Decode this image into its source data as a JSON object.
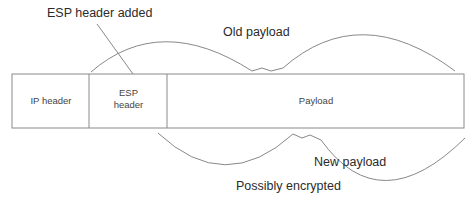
{
  "diagram": {
    "annotations": {
      "esp_added": "ESP header added",
      "old_payload": "Old payload",
      "new_payload": "New payload",
      "possibly_encrypted": "Possibly encrypted"
    },
    "packet": {
      "segments": [
        {
          "id": "ip-header",
          "label": "IP header"
        },
        {
          "id": "esp-header",
          "label_line1": "ESP",
          "label_line2": "header"
        },
        {
          "id": "payload",
          "label": "Payload"
        }
      ]
    },
    "colors": {
      "line": "#7a7a7a",
      "box": "#888888",
      "text": "#2b2b2b"
    }
  }
}
